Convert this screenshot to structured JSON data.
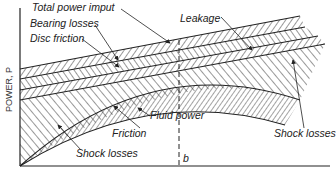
{
  "axes": {
    "y_label": "POWER, P",
    "x_marker": "b"
  },
  "labels": {
    "total_power_input": "Total power imput",
    "bearing_losses": "Bearing losses",
    "disc_friction": "Disc friction",
    "leakage": "Leakage",
    "friction": "Friction",
    "fluid_power": "Fluid power",
    "shock_losses_left": "Shock losses",
    "shock_losses_right": "Shock losses"
  },
  "colors": {
    "ink": "#222222",
    "background": "#ffffff"
  }
}
